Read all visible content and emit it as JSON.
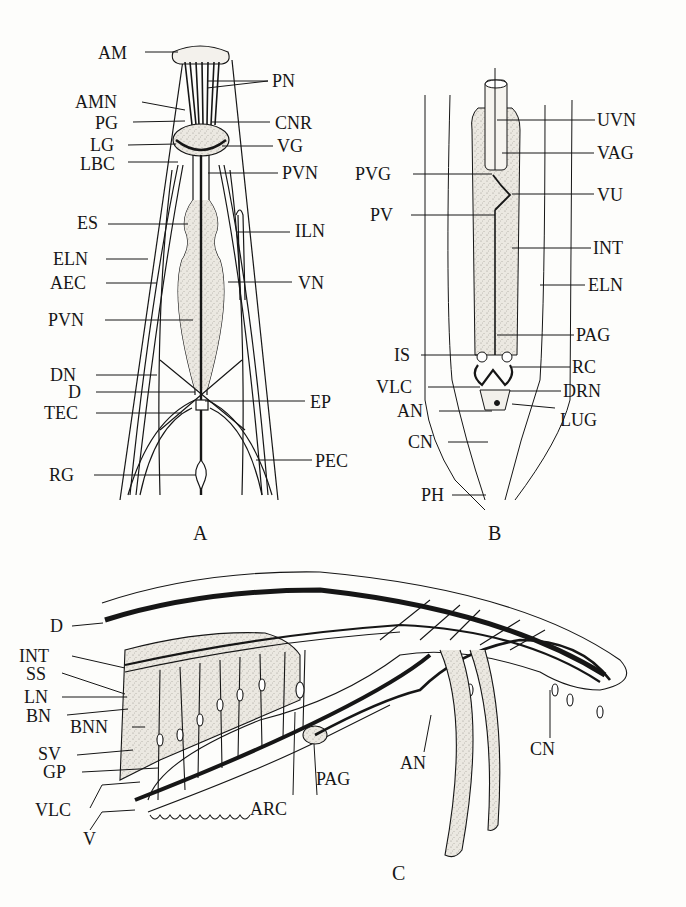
{
  "figure": {
    "colors": {
      "ink": "#161616",
      "stipple": "#d9d6cf",
      "background": "#fdfdfb"
    },
    "panels": {
      "A": {
        "letter": "A",
        "view": "anterior region, ventral view",
        "labels_left": [
          "AM",
          "AMN",
          "PG",
          "LG",
          "LBC",
          "ES",
          "ELN",
          "AEC",
          "PVN",
          "DN",
          "D",
          "TEC",
          "RG"
        ],
        "labels_right": [
          "PN",
          "CNR",
          "VG",
          "PVN",
          "ILN",
          "VN",
          "EP",
          "PEC"
        ]
      },
      "B": {
        "letter": "B",
        "view": "posterior region, ventral view",
        "labels_left": [
          "PVG",
          "PV",
          "IS",
          "VLC",
          "AN",
          "CN",
          "PH"
        ],
        "labels_right": [
          "UVN",
          "VAG",
          "VU",
          "INT",
          "ELN",
          "PAG",
          "RC",
          "DRN",
          "LUG"
        ]
      },
      "C": {
        "letter": "C",
        "view": "male tail, lateral view",
        "labels_left": [
          "D",
          "INT",
          "SS",
          "LN",
          "BN",
          "BNN",
          "SV",
          "GP",
          "VLC",
          "V"
        ],
        "labels_bottom": [
          "ARC",
          "PAG",
          "AN",
          "CN"
        ]
      }
    },
    "labels": {
      "a_am": "AM",
      "a_pn": "PN",
      "a_amn": "AMN",
      "a_pg": "PG",
      "a_cnr": "CNR",
      "a_lg": "LG",
      "a_vg": "VG",
      "a_lbc": "LBC",
      "a_pvn_r": "PVN",
      "a_es": "ES",
      "a_iln": "ILN",
      "a_eln": "ELN",
      "a_aec": "AEC",
      "a_vn": "VN",
      "a_pvn_l": "PVN",
      "a_dn": "DN",
      "a_d": "D",
      "a_ep": "EP",
      "a_tec": "TEC",
      "a_rg": "RG",
      "a_pec": "PEC",
      "b_uvn": "UVN",
      "b_vag": "VAG",
      "b_pvg": "PVG",
      "b_vu": "VU",
      "b_pv": "PV",
      "b_int": "INT",
      "b_eln": "ELN",
      "b_pag": "PAG",
      "b_is": "IS",
      "b_rc": "RC",
      "b_vlc": "VLC",
      "b_drn": "DRN",
      "b_an": "AN",
      "b_lug": "LUG",
      "b_cn": "CN",
      "b_ph": "PH",
      "c_d": "D",
      "c_int": "INT",
      "c_ss": "SS",
      "c_ln": "LN",
      "c_bn": "BN",
      "c_bnn": "BNN",
      "c_sv": "SV",
      "c_gp": "GP",
      "c_vlc": "VLC",
      "c_v": "V",
      "c_arc": "ARC",
      "c_pag": "PAG",
      "c_an": "AN",
      "c_cn": "CN"
    }
  }
}
